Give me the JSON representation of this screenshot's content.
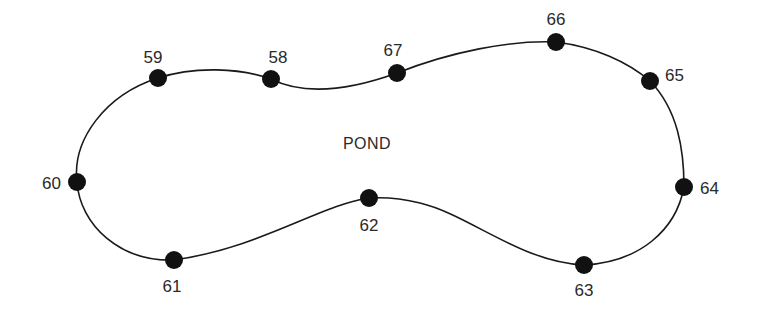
{
  "diagram": {
    "title": "POND",
    "title_pos": [
      367,
      149
    ],
    "line_color": "#1a1a1a",
    "point_color": "#111111",
    "point_radius": 9,
    "points": [
      {
        "id": "59",
        "x": 158,
        "y": 78,
        "label_x": 153,
        "label_y": 63,
        "anchor": "middle"
      },
      {
        "id": "58",
        "x": 271,
        "y": 79,
        "label_x": 278,
        "label_y": 63,
        "anchor": "middle"
      },
      {
        "id": "67",
        "x": 397,
        "y": 73,
        "label_x": 393,
        "label_y": 56,
        "anchor": "middle"
      },
      {
        "id": "66",
        "x": 556,
        "y": 42,
        "label_x": 556,
        "label_y": 25,
        "anchor": "middle"
      },
      {
        "id": "65",
        "x": 650,
        "y": 81,
        "label_x": 665,
        "label_y": 81,
        "anchor": "start"
      },
      {
        "id": "64",
        "x": 684,
        "y": 187,
        "label_x": 700,
        "label_y": 194,
        "anchor": "start"
      },
      {
        "id": "63",
        "x": 584,
        "y": 265,
        "label_x": 584,
        "label_y": 296,
        "anchor": "middle"
      },
      {
        "id": "62",
        "x": 369,
        "y": 198,
        "label_x": 369,
        "label_y": 231,
        "anchor": "middle"
      },
      {
        "id": "61",
        "x": 174,
        "y": 260,
        "label_x": 172,
        "label_y": 292,
        "anchor": "middle"
      },
      {
        "id": "60",
        "x": 77,
        "y": 182,
        "label_x": 61,
        "label_y": 189,
        "anchor": "end"
      }
    ],
    "outline_path": "M158,78 C195,66 240,68 271,79 C305,96 350,90 397,73 C450,52 510,40 556,42 C595,47 628,62 650,81 C678,110 684,150 684,187 C676,230 640,262 584,265 C520,262 470,215 420,203 C400,198 385,197 369,198 C320,205 260,248 174,260 C120,262 80,225 77,182 C72,140 105,95 158,78 Z"
  }
}
